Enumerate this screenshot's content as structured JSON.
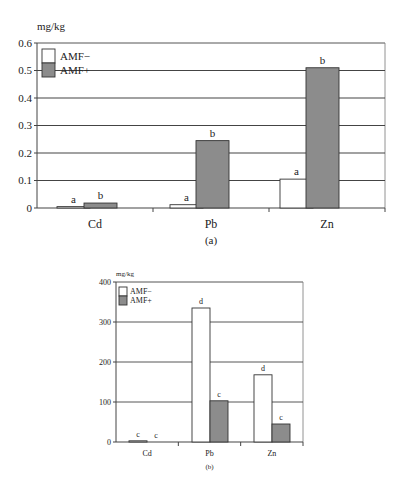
{
  "chart_data": [
    {
      "type": "bar",
      "title": "",
      "panel_label": "(a)",
      "ylabel": "mg/kg",
      "xlabel": "",
      "ylim": [
        0,
        0.6
      ],
      "yticks": [
        "0",
        "0.1",
        "0.2",
        "0.3",
        "0.4",
        "0.5",
        "0.6"
      ],
      "grid": true,
      "legend_position": "upper-left",
      "categories": [
        "Cd",
        "Pb",
        "Zn"
      ],
      "series": [
        {
          "name": "AMF−",
          "color": "#ffffff",
          "values": [
            0.005,
            0.012,
            0.105
          ],
          "labels": [
            "a",
            "a",
            "a"
          ]
        },
        {
          "name": "AMF+",
          "color": "#8c8c8c",
          "values": [
            0.018,
            0.245,
            0.51
          ],
          "labels": [
            "b",
            "b",
            "b"
          ]
        }
      ]
    },
    {
      "type": "bar",
      "title": "",
      "panel_label": "(b)",
      "ylabel": "mg/kg",
      "xlabel": "",
      "ylim": [
        0,
        400
      ],
      "yticks": [
        "0",
        "100",
        "200",
        "300",
        "400"
      ],
      "grid": true,
      "legend_position": "upper-left",
      "categories": [
        "Cd",
        "Pb",
        "Zn"
      ],
      "series": [
        {
          "name": "AMF−",
          "color": "#ffffff",
          "values": [
            3,
            335,
            168
          ],
          "labels": [
            "c",
            "d",
            "d"
          ]
        },
        {
          "name": "AMF+",
          "color": "#8c8c8c",
          "values": [
            0,
            103,
            45
          ],
          "labels": [
            "c",
            "c",
            "c"
          ]
        }
      ]
    }
  ]
}
